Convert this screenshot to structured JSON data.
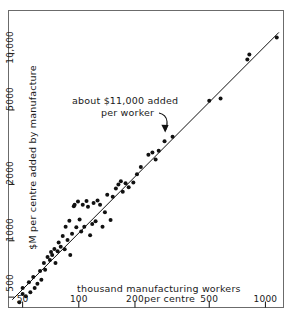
{
  "chart_data": {
    "type": "scatter",
    "title": "",
    "xlabel": "thousand manufacturing workers per centre",
    "ylabel": "$M per centre added by manufacture",
    "xscale": "log",
    "yscale": "log",
    "xlim": [
      42,
      1250
    ],
    "ylim": [
      440,
      17000
    ],
    "grid": false,
    "legend": null,
    "xtick_labels": [
      "50",
      "100",
      "200",
      "500",
      "1000"
    ],
    "xtick_values": [
      50,
      100,
      200,
      500,
      1000
    ],
    "ytick_labels": [
      "500",
      "1000",
      "2000",
      "5000",
      "10,000"
    ],
    "ytick_values": [
      500,
      1000,
      2000,
      5000,
      10000
    ],
    "annotations": [
      {
        "name": "slope-callout",
        "text_line1": "about $11,000 added",
        "text_line2": "per worker",
        "arrow": "curved arrow pointing down-right to fit line"
      }
    ],
    "fit_line": {
      "name": "11000-dollars-per-worker-line",
      "description": "straight line on log-log axes, slope 1, value added = $11,000 per worker",
      "slope_log": 1.0,
      "dollars_added_per_worker": 11000,
      "x_endpoints": [
        44,
        1180
      ],
      "y_endpoints": [
        484,
        12980
      ]
    },
    "series": [
      {
        "name": "manufacturing centres",
        "marker": "filled-circle",
        "color": "#111111",
        "points": [
          [
            48,
            470
          ],
          [
            50,
            520
          ],
          [
            50,
            560
          ],
          [
            52,
            505
          ],
          [
            54,
            600
          ],
          [
            55,
            530
          ],
          [
            57,
            640
          ],
          [
            58,
            560
          ],
          [
            60,
            590
          ],
          [
            62,
            690
          ],
          [
            63,
            620
          ],
          [
            65,
            760
          ],
          [
            66,
            700
          ],
          [
            68,
            820
          ],
          [
            70,
            790
          ],
          [
            71,
            870
          ],
          [
            72,
            840
          ],
          [
            74,
            905
          ],
          [
            75,
            760
          ],
          [
            77,
            880
          ],
          [
            78,
            980
          ],
          [
            80,
            930
          ],
          [
            82,
            1060
          ],
          [
            84,
            900
          ],
          [
            85,
            1190
          ],
          [
            87,
            1010
          ],
          [
            89,
            1280
          ],
          [
            90,
            840
          ],
          [
            92,
            1090
          ],
          [
            94,
            1530
          ],
          [
            95,
            1560
          ],
          [
            97,
            1180
          ],
          [
            99,
            1620
          ],
          [
            101,
            1300
          ],
          [
            103,
            1120
          ],
          [
            105,
            1560
          ],
          [
            107,
            1190
          ],
          [
            110,
            1630
          ],
          [
            112,
            1520
          ],
          [
            115,
            1070
          ],
          [
            118,
            1230
          ],
          [
            120,
            1590
          ],
          [
            123,
            1270
          ],
          [
            126,
            1640
          ],
          [
            130,
            1560
          ],
          [
            134,
            1190
          ],
          [
            138,
            1420
          ],
          [
            142,
            1760
          ],
          [
            148,
            1290
          ],
          [
            152,
            1720
          ],
          [
            158,
            1900
          ],
          [
            163,
            2000
          ],
          [
            168,
            2080
          ],
          [
            172,
            1830
          ],
          [
            178,
            2030
          ],
          [
            185,
            1930
          ],
          [
            196,
            2050
          ],
          [
            205,
            2270
          ],
          [
            215,
            2480
          ],
          [
            236,
            2880
          ],
          [
            248,
            2960
          ],
          [
            258,
            2720
          ],
          [
            268,
            3030
          ],
          [
            288,
            3400
          ],
          [
            318,
            3600
          ],
          [
            500,
            5600
          ],
          [
            575,
            5750
          ],
          [
            800,
            9300
          ],
          [
            820,
            9900
          ],
          [
            1150,
            12200
          ]
        ]
      }
    ]
  },
  "ylabel_text": "$M per centre added by manufacture",
  "xlabel_line1": "thousand manufacturing workers",
  "xlabel_line2": "per centre",
  "anno_line1": "about $11,000 added",
  "anno_line2": "per worker",
  "colors": {
    "ink": "#111111",
    "frame": "#6b6b6b",
    "background": "#ffffff"
  }
}
